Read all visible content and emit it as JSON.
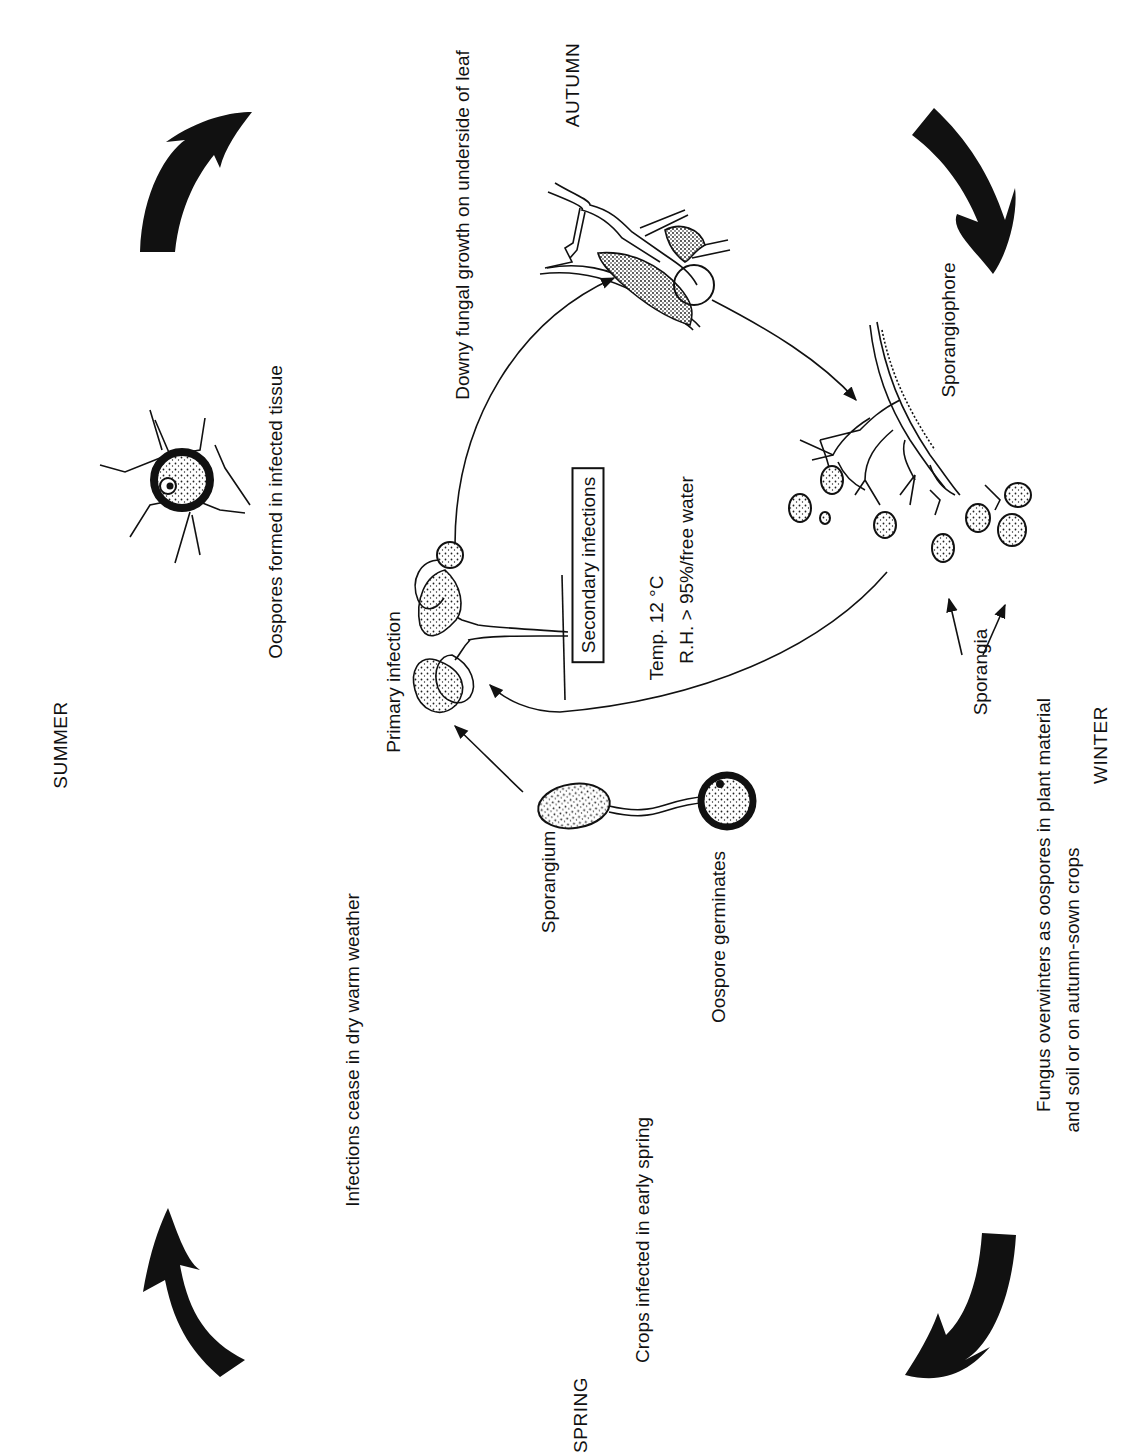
{
  "diagram": {
    "type": "disease-life-cycle",
    "orientation": "rotated 90 degrees counter-clockwise",
    "seasons": {
      "summer": "SUMMER",
      "autumn": "AUTUMN",
      "winter": "WINTER",
      "spring": "SPRING"
    },
    "stages": {
      "oospores_formed": "Oospores formed in infected tissue",
      "infections_cease": "Infections cease in dry warm weather",
      "crops_infected": "Crops infected in early spring",
      "primary_infection": "Primary infection",
      "secondary_infections": "Secondary infections",
      "temperature": "Temp. 12 °C",
      "humidity": "R.H. > 95%/free water",
      "downy_growth": "Downy fungal growth on underside of leaf",
      "sporangiophore": "Sporangiophore",
      "sporangia": "Sporangia",
      "overwinter_line1": "Fungus overwinters as oospores in plant material",
      "overwinter_line2": "and soil or on autumn-sown crops",
      "sporangium": "Sporangium",
      "oospore_germinates": "Oospore germinates"
    },
    "flow": [
      "Oospore germinates -> Sporangium -> Primary infection",
      "Primary infection -> Downy fungal growth on underside of leaf",
      "Downy fungal growth -> Sporangiophore",
      "Sporangiophore/Sporangia -> Primary infection (secondary infections)"
    ],
    "season_arrows": [
      "summer-to-autumn",
      "autumn-to-winter",
      "winter-to-spring",
      "spring-to-summer"
    ],
    "colors": {
      "ink": "#111111",
      "background": "#ffffff"
    }
  }
}
